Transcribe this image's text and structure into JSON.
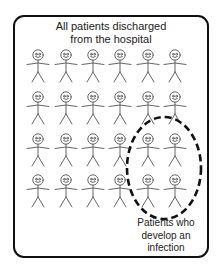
{
  "diagram": {
    "title_lines": [
      "All patients discharged",
      "from the hospital"
    ],
    "caption_lines": [
      "Patients who",
      "develop an",
      "infection"
    ],
    "grid": {
      "rows": 4,
      "cols": 6,
      "total_figures": 24,
      "col_x": [
        38,
        66,
        93,
        120,
        148,
        175
      ],
      "row_y": [
        55,
        97,
        139,
        180
      ]
    },
    "highlighted_subset": {
      "description": "dashed ellipse enclosing the last two columns of rows 3 and 4",
      "count": 4,
      "ellipse": {
        "cx": 164,
        "cy": 168,
        "rx": 37,
        "ry": 51
      }
    },
    "colors": {
      "frame": "#111111",
      "figure": "#555555",
      "ellipse": "#111111",
      "text": "#222222"
    }
  }
}
